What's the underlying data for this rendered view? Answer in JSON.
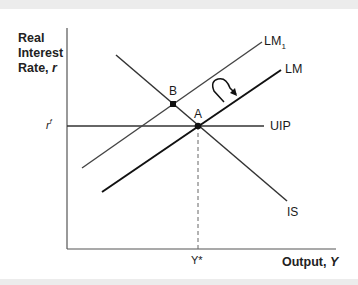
{
  "figure": {
    "y_axis_label_line1": "Real",
    "y_axis_label_line2": "Interest",
    "y_axis_label_line3": "Rate, ",
    "y_axis_label_var": "r",
    "x_axis_label": "Output, ",
    "x_axis_label_var": "Y",
    "rf_label": "r",
    "rf_sup": "f",
    "ystar_label": "Y*",
    "curves": {
      "lm1": "LM",
      "lm1_sub": "1",
      "lm": "LM",
      "uip": "UIP",
      "is": "IS"
    },
    "points": {
      "a": "A",
      "b": "B"
    }
  }
}
